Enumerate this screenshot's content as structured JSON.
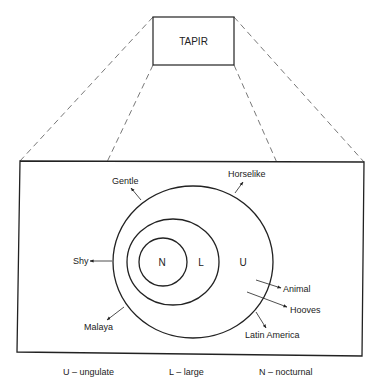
{
  "diagram": {
    "title_box": {
      "label": "TAPIR"
    },
    "regions": [
      {
        "key": "N",
        "meaning": "nocturnal",
        "level": "inner"
      },
      {
        "key": "L",
        "meaning": "large",
        "level": "middle"
      },
      {
        "key": "U",
        "meaning": "ungulate",
        "level": "outer"
      }
    ],
    "attributes": [
      {
        "label": "Gentle"
      },
      {
        "label": "Horselike"
      },
      {
        "label": "Shy"
      },
      {
        "label": "Malaya"
      },
      {
        "label": "Animal"
      },
      {
        "label": "Hooves"
      },
      {
        "label": "Latin America"
      }
    ],
    "legend": [
      {
        "text": "U – ungulate"
      },
      {
        "text": "L – large"
      },
      {
        "text": "N – nocturnal"
      }
    ]
  }
}
